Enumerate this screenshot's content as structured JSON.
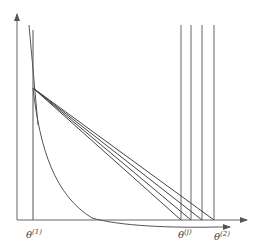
{
  "diagram": {
    "labels": {
      "theta1": "θ",
      "theta1_sup": "(1)",
      "thetaj": "θ",
      "thetaj_sup": "(j)",
      "theta2": "θ",
      "theta2_sup": "(2)"
    },
    "colors": {
      "stroke": "#555555",
      "background": "#ffffff"
    }
  }
}
